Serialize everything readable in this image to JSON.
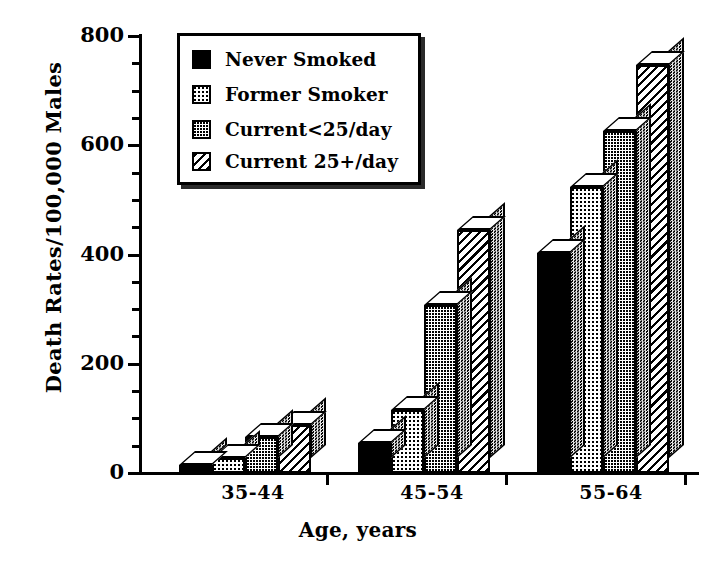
{
  "chart_data": {
    "type": "bar",
    "title": "",
    "xlabel": "Age, years",
    "ylabel": "Death Rates/100,000 Males",
    "categories": [
      "35-44",
      "45-54",
      "55-64"
    ],
    "ylim": [
      0,
      800
    ],
    "yticks": [
      0,
      200,
      400,
      600,
      800
    ],
    "ytick_labels": [
      "0",
      "200",
      "400",
      "600",
      "800"
    ],
    "yminor_ticks": [
      50,
      100,
      150,
      250,
      300,
      350,
      450,
      500,
      550,
      650,
      700,
      750
    ],
    "grid": false,
    "legend_position": "upper-left-inside",
    "style": "3d-bar",
    "series": [
      {
        "name": "Never Smoked",
        "fill": "solid-black",
        "values": [
          15,
          55,
          402
        ]
      },
      {
        "name": "Former Smoker",
        "fill": "light-dots",
        "values": [
          28,
          115,
          524
        ]
      },
      {
        "name": "Current<25/day",
        "fill": "checker",
        "values": [
          66,
          308,
          627
        ]
      },
      {
        "name": "Current 25+/day",
        "fill": "diagonal-hatch",
        "values": [
          88,
          444,
          746
        ]
      }
    ]
  },
  "legend": {
    "items": [
      {
        "label": "Never Smoked",
        "swatch": "solid-black-swatch"
      },
      {
        "label": "Former Smoker",
        "swatch": "light-dots-swatch"
      },
      {
        "label": "Current<25/day",
        "swatch": "checker-swatch"
      },
      {
        "label": "Current 25+/day",
        "swatch": "diagonal-hatch-swatch"
      }
    ]
  },
  "axis": {
    "y_title": "Death Rates/100,000 Males",
    "x_title": "Age, years"
  },
  "colors": {
    "ink": "#000000",
    "paper": "#ffffff",
    "shadow": "#2b2b2b"
  },
  "bottom_caption": ""
}
